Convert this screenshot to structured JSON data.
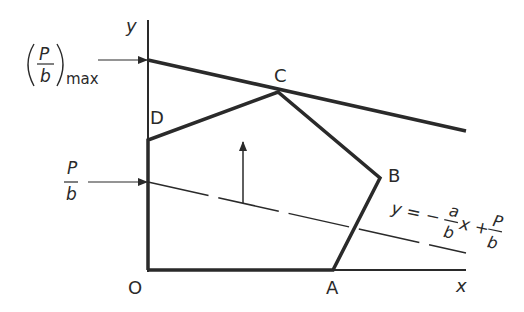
{
  "diagram": {
    "axes": {
      "x_label": "x",
      "y_label": "y",
      "origin_label": "O"
    },
    "vertices": {
      "A": "A",
      "B": "B",
      "C": "C",
      "D": "D"
    },
    "labels": {
      "pmax_num": "P",
      "pmax_den": "b",
      "pmax_sub": "max",
      "pb_num": "P",
      "pb_den": "b",
      "eq_lhs": "y = −",
      "eq_a": "a",
      "eq_b1": "b",
      "eq_mid": "x +",
      "eq_P": "P",
      "eq_b2": "b"
    },
    "colors": {
      "line": "#2a2a2a"
    }
  }
}
